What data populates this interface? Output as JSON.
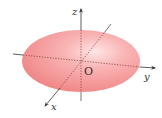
{
  "diagram": {
    "shape": "ellipsoid",
    "fill_color": "#f48c8c",
    "highlight_color": "#fde4e4",
    "axis_color": "#333333",
    "labels": {
      "x": "x",
      "y": "y",
      "z": "z",
      "origin": "O"
    }
  }
}
